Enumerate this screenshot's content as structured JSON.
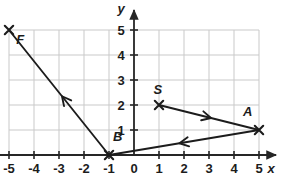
{
  "chart_data": {
    "type": "scatter",
    "title": "",
    "xlabel": "x",
    "ylabel": "y",
    "xlim": [
      -5,
      5
    ],
    "ylim": [
      0,
      5
    ],
    "grid": true,
    "legend": "none",
    "xticks": [
      "-5",
      "-4",
      "-3",
      "-2",
      "-1",
      "0",
      "1",
      "2",
      "3",
      "4",
      "5"
    ],
    "xtick_values": [
      -5,
      -4,
      -3,
      -2,
      -1,
      0,
      1,
      2,
      3,
      4,
      5
    ],
    "yticks": [
      "1",
      "2",
      "3",
      "4",
      "5"
    ],
    "ytick_values": [
      1,
      2,
      3,
      4,
      5
    ],
    "points": [
      {
        "label": "F",
        "x": -5,
        "y": 5,
        "marker": "x",
        "label_dx": 0.45,
        "label_dy": -0.35
      },
      {
        "label": "B",
        "x": -1,
        "y": 0,
        "marker": "x",
        "label_dx": 0.35,
        "label_dy": 0.75
      },
      {
        "label": "S",
        "x": 1,
        "y": 2,
        "marker": "x",
        "label_dx": -0.05,
        "label_dy": 0.65
      },
      {
        "label": "A",
        "x": 5,
        "y": 1,
        "marker": "x",
        "label_dx": -0.45,
        "label_dy": 0.75
      }
    ],
    "segments": [
      {
        "name": "B-to-F",
        "from": {
          "x": -1,
          "y": 0
        },
        "to": {
          "x": -5,
          "y": 5
        },
        "arrow_at": 0.47,
        "arrow_direction": "to"
      },
      {
        "name": "S-to-A",
        "from": {
          "x": 1,
          "y": 2
        },
        "to": {
          "x": 5,
          "y": 1
        },
        "arrow_at": 0.52,
        "arrow_direction": "to"
      },
      {
        "name": "A-to-B",
        "from": {
          "x": 5,
          "y": 1
        },
        "to": {
          "x": -1,
          "y": 0
        },
        "arrow_at": 0.53,
        "arrow_direction": "to"
      }
    ],
    "colors": {
      "grid": "#c9c9c9",
      "axis": "#262626",
      "line": "#1c1c1c",
      "text": "#1c1c1c",
      "background": "#ffffff"
    }
  }
}
